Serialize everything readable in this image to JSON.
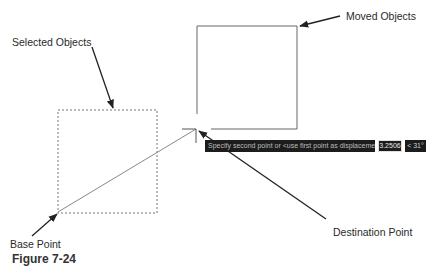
{
  "labels": {
    "selected_objects": "Selected Objects",
    "moved_objects": "Moved Objects",
    "base_point": "Base Point",
    "destination_point": "Destination Point"
  },
  "command_tooltip": {
    "prompt": "Specify second point or <use first point as displacement>:",
    "distance_value": "3.2506",
    "angle_value": "< 31°"
  },
  "caption": "Figure 7-24",
  "colors": {
    "tooltip_bg": "#1c1c1c",
    "line": "#555555",
    "arrow": "#222222"
  }
}
